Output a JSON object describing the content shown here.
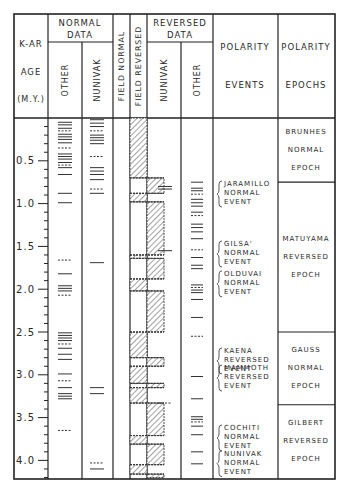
{
  "header": {
    "age_col": [
      "K-AR",
      "AGE",
      "(M.Y.)"
    ],
    "normal_data": {
      "title_line1": "NORMAL",
      "title_line2": "DATA",
      "sub": [
        "OTHER",
        "NUNIVAK"
      ]
    },
    "field_normal": "FIELD NORMAL",
    "field_reversed": "FIELD REVERSED",
    "reversed_data": {
      "title_line1": "REVERSED",
      "title_line2": "DATA",
      "sub": [
        "NUNIVAK",
        "OTHER"
      ]
    },
    "polarity_events": [
      "POLARITY",
      "EVENTS"
    ],
    "polarity_epochs": [
      "POLARITY",
      "EPOCHS"
    ]
  },
  "axis": {
    "ticks": [
      "0.5",
      "1.0",
      "1.5",
      "2.0",
      "2.5",
      "3.0",
      "3.5",
      "4.0"
    ],
    "min": 0,
    "max": 4.2,
    "minor_step": 0.1
  },
  "events": [
    {
      "lines": [
        "JARAMILLO",
        "NORMAL",
        "EVENT"
      ],
      "age": 0.9
    },
    {
      "lines": [
        "GILSA'",
        "NORMAL",
        "EVENT"
      ],
      "age": 1.6
    },
    {
      "lines": [
        "OLDUVAI",
        "NORMAL",
        "EVENT"
      ],
      "age": 1.95
    },
    {
      "lines": [
        "KAENA",
        "REVERSED",
        "EVENT"
      ],
      "age": 2.85
    },
    {
      "lines": [
        "MAMMOTH",
        "REVERSED",
        "EVENT"
      ],
      "age": 3.05
    },
    {
      "lines": [
        "COCHITI",
        "NORMAL",
        "EVENT"
      ],
      "age": 3.75
    },
    {
      "lines": [
        "NUNIVAK",
        "NORMAL",
        "EVENT"
      ],
      "age": 4.05
    }
  ],
  "epochs": [
    {
      "lines": [
        "BRUNHES",
        "NORMAL",
        "EPOCH"
      ],
      "start": 0,
      "end": 0.75
    },
    {
      "lines": [
        "MATUYAMA",
        "REVERSED",
        "EPOCH"
      ],
      "start": 0.75,
      "end": 2.5
    },
    {
      "lines": [
        "GAUSS",
        "NORMAL",
        "EPOCH"
      ],
      "start": 2.5,
      "end": 3.35
    },
    {
      "lines": [
        "GILBERT",
        "REVERSED",
        "EPOCH"
      ],
      "start": 3.35,
      "end": 4.2
    }
  ],
  "field_normal_intervals": [
    [
      0,
      0.7
    ],
    [
      0.88,
      0.98
    ],
    [
      1.6,
      1.64
    ],
    [
      1.88,
      2.02
    ],
    [
      2.5,
      2.8
    ],
    [
      2.9,
      3.1
    ],
    [
      3.15,
      3.33
    ],
    [
      3.71,
      3.81
    ],
    [
      4.05,
      4.16
    ]
  ],
  "field_reversed_intervals": [
    [
      0.7,
      0.88
    ],
    [
      0.98,
      1.6
    ],
    [
      1.64,
      1.88
    ],
    [
      2.02,
      2.5
    ],
    [
      2.8,
      2.9
    ],
    [
      3.1,
      3.15
    ],
    [
      3.33,
      3.71
    ],
    [
      3.81,
      4.05
    ],
    [
      4.16,
      4.2
    ]
  ],
  "data_marks": {
    "normal_other": [
      0.05,
      0.08,
      0.12,
      0.15,
      0.19,
      0.22,
      0.25,
      0.29,
      0.35,
      0.42,
      0.45,
      0.48,
      0.52,
      0.55,
      0.58,
      0.66,
      0.88,
      0.99,
      1.66,
      1.82,
      1.96,
      1.99,
      2.02,
      2.07,
      2.51,
      2.54,
      2.57,
      2.6,
      2.64,
      2.69,
      2.76,
      2.82,
      2.99,
      3.07,
      3.15,
      3.22,
      3.25,
      3.28,
      3.65
    ],
    "normal_nunivak": [
      0.02,
      0.06,
      0.1,
      0.15,
      0.2,
      0.23,
      0.26,
      0.3,
      0.45,
      0.58,
      0.62,
      0.66,
      0.72,
      0.83,
      0.88,
      1.69,
      3.15,
      3.22,
      4.03,
      4.1
    ],
    "reversed_nunivak": [
      0.8,
      0.83,
      1.55,
      3.33
    ],
    "reversed_other": [
      0.75,
      0.82,
      0.85,
      0.89,
      0.95,
      0.99,
      1.03,
      1.1,
      1.14,
      1.24,
      1.28,
      1.33,
      1.41,
      1.54,
      1.63,
      1.72,
      1.76,
      1.95,
      1.98,
      2.01,
      2.04,
      2.12,
      2.33,
      2.55,
      3.02,
      3.28,
      3.49,
      3.52,
      3.55,
      3.6,
      3.7,
      3.9,
      4.04
    ]
  }
}
